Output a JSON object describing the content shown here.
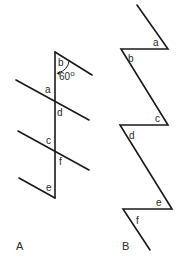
{
  "diagram_a": {
    "panel_label": "A",
    "angle_labels": {
      "a": "a",
      "b": "b",
      "c": "c",
      "d": "d",
      "e": "e",
      "f": "f"
    },
    "angle_value": "60",
    "degree_symbol": "o"
  },
  "diagram_b": {
    "panel_label": "B",
    "angle_labels": {
      "a": "a",
      "b": "b",
      "c": "c",
      "d": "d",
      "e": "e",
      "f": "f"
    }
  },
  "colors": {
    "line": "#1a1a1a",
    "text": "#2a2a2a",
    "background": "#ffffff"
  }
}
